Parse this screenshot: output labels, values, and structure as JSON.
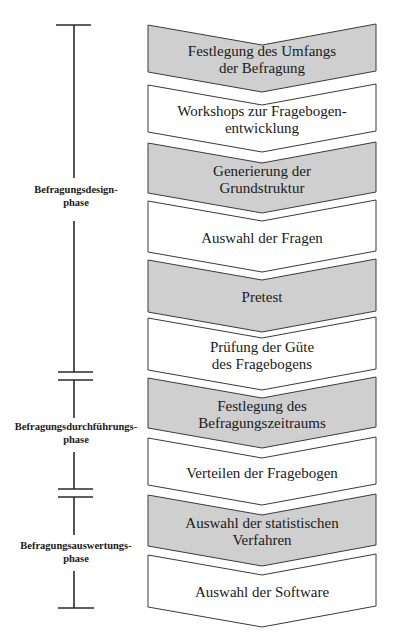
{
  "colors": {
    "shaded": "#cfcfcf",
    "plain": "#ffffff",
    "stroke": "#3a3a3a",
    "text": "#1a1a1a"
  },
  "steps": [
    {
      "lines": [
        "Festlegung des Umfangs",
        "der Befragung"
      ],
      "shaded": true,
      "top": 25,
      "bottom": 72
    },
    {
      "lines": [
        "Workshops zur Fragebogen-",
        "entwicklung"
      ],
      "shaded": false,
      "top": 85,
      "bottom": 132
    },
    {
      "lines": [
        "Generierung der",
        "Grundstruktur"
      ],
      "shaded": true,
      "top": 143,
      "bottom": 193
    },
    {
      "lines": [
        "Auswahl der Fragen"
      ],
      "shaded": false,
      "top": 201,
      "bottom": 252
    },
    {
      "lines": [
        "Pretest"
      ],
      "shaded": true,
      "top": 260,
      "bottom": 312
    },
    {
      "lines": [
        "Prüfung der Güte",
        "des Fragebogens"
      ],
      "shaded": false,
      "top": 318,
      "bottom": 370
    },
    {
      "lines": [
        "Festlegung des",
        "Befragungszeitraums"
      ],
      "shaded": true,
      "top": 378,
      "bottom": 428
    },
    {
      "lines": [
        "Verteilen der Fragebogen"
      ],
      "shaded": false,
      "top": 438,
      "bottom": 485
    },
    {
      "lines": [
        "Auswahl der statistischen",
        "Verfahren"
      ],
      "shaded": true,
      "top": 495,
      "bottom": 546
    },
    {
      "lines": [
        "Auswahl der Software"
      ],
      "shaded": false,
      "top": 555,
      "bottom": 607
    }
  ],
  "phases": [
    {
      "lines": [
        "Befragungsdesign-",
        "phase"
      ],
      "label_y": 193
    },
    {
      "lines": [
        "Befragungsdurchführungs-",
        "phase"
      ],
      "label_y": 430
    },
    {
      "lines": [
        "Befragungsauswertungs-",
        "phase"
      ],
      "label_y": 549
    }
  ],
  "timeline": {
    "x": 74,
    "top_bar_y": 25,
    "bottom_bar_y": 608,
    "segments": [
      [
        25,
        178
      ],
      [
        221,
        372
      ],
      [
        380,
        418
      ],
      [
        452,
        489
      ],
      [
        497,
        535
      ],
      [
        571,
        608
      ]
    ],
    "double_bars": [
      [
        372,
        380
      ],
      [
        489,
        497
      ]
    ]
  }
}
